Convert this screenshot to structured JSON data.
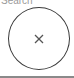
{
  "header": {
    "label": "Search"
  },
  "close_button": {
    "icon": "close-icon",
    "glyph": "×"
  },
  "colors": {
    "border": "#3a3a3a",
    "icon": "#555555",
    "divider": "#8a8a8a"
  }
}
